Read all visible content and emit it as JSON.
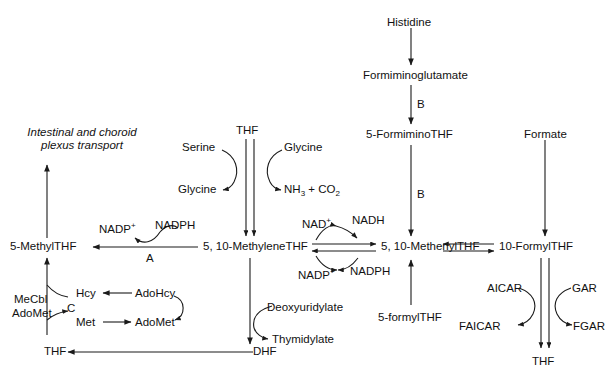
{
  "diagram": {
    "stroke_color": "#1a1a1a",
    "background": "#ffffff",
    "nodes": {
      "intestinal_transport_line1": "Intestinal and choroid",
      "intestinal_transport_line2": "plexus transport",
      "methyl_thf": "5-MethylTHF",
      "methylene_thf": "5, 10-MethyleneTHF",
      "methenyl_thf": "5, 10-MethenylTHF",
      "formyl_thf_10": "10-FormylTHF",
      "formimino_thf": "5-FormiminoTHF",
      "formyl_thf_5": "5-formylTHF",
      "histidine": "Histidine",
      "formiminoglutamate": "Formiminoglutamate",
      "formate": "Formate",
      "thf_top": "THF",
      "thf_bottom_left": "THF",
      "thf_bottom_right": "THF",
      "dhf": "DHF",
      "serine": "Serine",
      "glycine_in": "Glycine",
      "glycine_out": "Glycine",
      "deoxyuridylate": "Deoxyuridylate",
      "thymidylate": "Thymidylate",
      "hcy": "Hcy",
      "met": "Met",
      "adohcy": "AdoHcy",
      "adomet": "AdoMet",
      "aicar": "AICAR",
      "faicar": "FAICAR",
      "gar": "GAR",
      "fgar": "FGAR"
    },
    "cofactors": {
      "nadp_plus_left": "NADP",
      "nadp_plus_left_charge": "+",
      "nadph_left": "NADPH",
      "nad_plus": "NAD",
      "nad_plus_charge": "+",
      "nadh": "NADH",
      "nadp_plus_lower": "NADP",
      "nadp_plus_lower_charge": "+",
      "nadph_lower": "NADPH",
      "mecbl": "MeCbl",
      "adomet_cofactor": "AdoMet"
    },
    "products": {
      "ammonia_co2_nh": "NH",
      "ammonia_co2_nh_sub": "3",
      "ammonia_co2_plus": " + CO",
      "ammonia_co2_co_sub": "2"
    },
    "enzymes": {
      "a": "A",
      "b_upper": "B",
      "b_lower": "B",
      "c": "C"
    }
  }
}
